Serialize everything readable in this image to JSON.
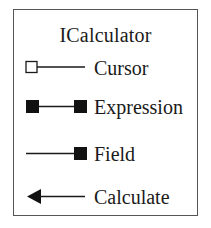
{
  "legend": {
    "title": "ICalculator",
    "items": [
      {
        "label": "Cursor",
        "symbol": "open-square-origin-line"
      },
      {
        "label": "Expression",
        "symbol": "filled-square-both-ends-line"
      },
      {
        "label": "Field",
        "symbol": "line-filled-square-end"
      },
      {
        "label": "Calculate",
        "symbol": "arrow-left-line"
      }
    ]
  },
  "colors": {
    "stroke": "#1a1a1a",
    "border": "#555555",
    "background": "#ffffff"
  }
}
